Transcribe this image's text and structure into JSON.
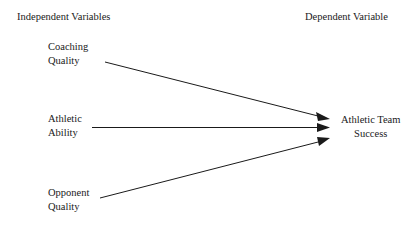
{
  "diagram": {
    "background_color": "#ffffff",
    "line_color": "#1a1a1a",
    "text_color": "#1a1a1a"
  },
  "headers": {
    "independent": "Independent Variables",
    "dependent": "Dependent Variable"
  },
  "independent_nodes": [
    {
      "line1": "Coaching",
      "line2": "Quality"
    },
    {
      "line1": "Athletic",
      "line2": "Ability"
    },
    {
      "line1": "Opponent",
      "line2": "Quality"
    }
  ],
  "dependent_node": {
    "line1": "Athletic Team",
    "line2": "Success"
  },
  "arrows": [
    {
      "name": "coaching-to-success",
      "from": "Coaching Quality",
      "to": "Athletic Team Success",
      "direction": "down-right"
    },
    {
      "name": "athletic-to-success",
      "from": "Athletic Ability",
      "to": "Athletic Team Success",
      "direction": "horizontal"
    },
    {
      "name": "opponent-to-success",
      "from": "Opponent Quality",
      "to": "Athletic Team Success",
      "direction": "up-right"
    }
  ]
}
